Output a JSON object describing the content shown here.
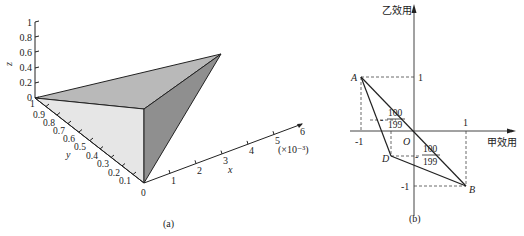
{
  "figure_a": {
    "caption": "(a)",
    "z_axis": {
      "label": "z",
      "ticks": [
        "0",
        "0.2",
        "0.4",
        "0.6",
        "0.8",
        "1"
      ]
    },
    "y_axis": {
      "label": "y",
      "ticks": [
        "1",
        "0.9",
        "0.8",
        "0.7",
        "0.6",
        "0.5",
        "0.4",
        "0.3",
        "0.2",
        "0.1",
        "0"
      ]
    },
    "x_axis": {
      "label": "x",
      "ticks": [
        "1",
        "2",
        "3",
        "4",
        "5",
        "6"
      ],
      "scale": "(×10⁻³)"
    },
    "colors": {
      "top_face": "#b9b9b9",
      "left_face": "#e6e6e6",
      "right_face": "#8f8f8f"
    }
  },
  "figure_b": {
    "caption": "(b)",
    "y_axis_label": "乙效用",
    "x_axis_label": "甲效用",
    "origin_label": "O",
    "points": {
      "A": "A",
      "B": "B",
      "D": "D"
    },
    "ticks": {
      "x_neg": "-1",
      "x_pos": "1",
      "y_pos": "1",
      "y_neg": "-1"
    },
    "fraction_upper": {
      "sign": "-",
      "num": "100",
      "den": "199"
    },
    "fraction_lower": {
      "sign": "-",
      "num": "100",
      "den": "199"
    }
  }
}
